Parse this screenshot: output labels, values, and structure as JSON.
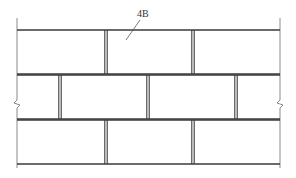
{
  "diagram": {
    "type": "brick-wall-elevation",
    "label": {
      "text": "4B",
      "x": 137,
      "y": 9,
      "leader": {
        "x1": 140,
        "y1": 20,
        "x2": 126,
        "y2": 40
      }
    },
    "wall": {
      "left_edge_x": 17,
      "right_edge_x": 280,
      "edge_top_y": 18,
      "edge_bottom_y": 168,
      "break_marks": [
        {
          "side": "left",
          "x": 17,
          "y": 104
        },
        {
          "side": "right",
          "x": 280,
          "y": 104
        }
      ]
    },
    "courses": [
      {
        "top": 30,
        "bottom": 74,
        "joints": [
          106,
          193
        ]
      },
      {
        "top": 75,
        "bottom": 119,
        "joints": [
          60,
          148,
          236
        ]
      },
      {
        "top": 120,
        "bottom": 164,
        "joints": [
          106,
          193
        ]
      }
    ],
    "colors": {
      "line": "#3a3a3a",
      "edge": "#8a8a8a",
      "background": "#ffffff"
    }
  }
}
